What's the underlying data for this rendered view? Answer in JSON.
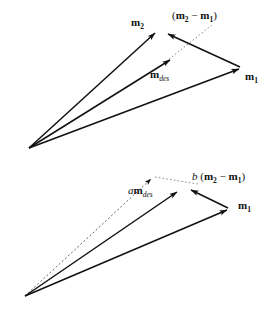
{
  "figure": {
    "title": "",
    "type": "vector-diagram",
    "background_color": "#ffffff",
    "stroke_color": "#111111",
    "panels": [
      {
        "id": "top-panel",
        "name": "unscaled-vector-triangle",
        "origin": {
          "x": 29,
          "y": 148
        },
        "vectors": [
          {
            "name": "m2",
            "label": "m",
            "subscript": "2",
            "style": "solid",
            "from": {
              "x": 29,
              "y": 148
            },
            "to": {
              "x": 157,
              "y": 31
            },
            "label_pos": {
              "x": 131,
              "y": 26
            }
          },
          {
            "name": "mdes",
            "label": "m",
            "subscript": "des",
            "style": "solid",
            "from": {
              "x": 29,
              "y": 148
            },
            "to": {
              "x": 172,
              "y": 58
            },
            "label_pos": {
              "x": 150,
              "y": 78
            }
          },
          {
            "name": "m1",
            "label": "m",
            "subscript": "1",
            "style": "solid",
            "from": {
              "x": 29,
              "y": 148
            },
            "to": {
              "x": 241,
              "y": 67
            },
            "label_pos": {
              "x": 247,
              "y": 80
            }
          },
          {
            "name": "m2-minus-m1",
            "label": "(m₂ − m₁)",
            "style": "solid",
            "from": {
              "x": 241,
              "y": 67
            },
            "to": {
              "x": 166,
              "y": 32
            },
            "label_pos": {
              "x": 172,
              "y": 19
            }
          },
          {
            "name": "guide-dotted",
            "label": "",
            "style": "dotted",
            "from": {
              "x": 163,
              "y": 64
            },
            "to": {
              "x": 212,
              "y": 25
            }
          }
        ]
      },
      {
        "id": "bottom-panel",
        "name": "scaled-vector-triangle",
        "origin": {
          "x": 25,
          "y": 296
        },
        "vectors": [
          {
            "name": "a-mdes",
            "label": "am",
            "subscript": "des",
            "style": "dashed",
            "from": {
              "x": 25,
              "y": 296
            },
            "to": {
              "x": 153,
              "y": 177
            },
            "label_pos": {
              "x": 131,
              "y": 194
            }
          },
          {
            "name": "partial-mdes",
            "label": "",
            "style": "solid",
            "from": {
              "x": 25,
              "y": 296
            },
            "to": {
              "x": 179,
              "y": 190
            }
          },
          {
            "name": "m1",
            "label": "m",
            "subscript": "1",
            "style": "solid",
            "from": {
              "x": 25,
              "y": 296
            },
            "to": {
              "x": 229,
              "y": 208
            },
            "label_pos": {
              "x": 238,
              "y": 209
            }
          },
          {
            "name": "b-times-m2-minus-m1",
            "label": "b (m₂ − m₁)",
            "style": "solid",
            "from": {
              "x": 229,
              "y": 208
            },
            "to": {
              "x": 189,
              "y": 189
            },
            "label_pos": {
              "x": 192,
              "y": 180
            }
          },
          {
            "name": "guide-dotted",
            "label": "",
            "style": "dotted",
            "from": {
              "x": 153,
              "y": 177
            },
            "to": {
              "x": 197,
              "y": 184
            }
          }
        ]
      }
    ],
    "labels": {
      "top": {
        "m2": "m",
        "m2_sub": "2",
        "mdes": "m",
        "mdes_sub": "des",
        "m1": "m",
        "m1_sub": "1",
        "diff_open": "(",
        "diff_a": "m",
        "diff_a_sub": "2",
        "diff_minus": "−",
        "diff_b": "m",
        "diff_b_sub": "1",
        "diff_close": ")"
      },
      "bottom": {
        "amdes_a": "a",
        "amdes_m": "m",
        "amdes_sub": "des",
        "m1": "m",
        "m1_sub": "1",
        "b_coef": "b",
        "diff_open": "(",
        "diff_a": "m",
        "diff_a_sub": "2",
        "diff_minus": "−",
        "diff_b": "m",
        "diff_b_sub": "1",
        "diff_close": ")"
      }
    }
  }
}
